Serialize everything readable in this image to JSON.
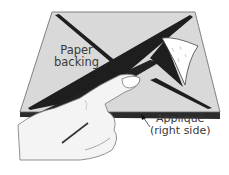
{
  "illustration": {
    "subject": "Peeling paper backing from fusible appliqué",
    "labels": {
      "paper_backing_line1": "Paper",
      "paper_backing_line2": "backing",
      "applique_line1": "Appliqué",
      "applique_line2": "(right side)"
    },
    "colors": {
      "paper": "#d9d9d9",
      "applique_edge": "#2b2b2b",
      "dark_strip": "#1e1e1e",
      "hand": "#f4f4f4",
      "outline": "#555555"
    }
  }
}
